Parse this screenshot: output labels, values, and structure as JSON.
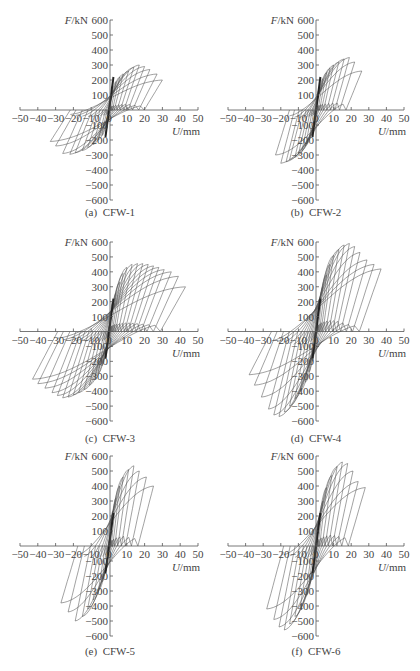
{
  "figure": {
    "x_unit_label": "U/mm",
    "y_unit_label": "F/kN"
  },
  "chart_data": [
    {
      "id": "a",
      "type": "line",
      "title": "(a) CFW-1",
      "caption_tag": "(a)",
      "specimen": "CFW-1",
      "xlabel": "U/mm",
      "ylabel": "F/kN",
      "xlim": [
        -50,
        50
      ],
      "ylim": [
        -600,
        600
      ],
      "xticks": [
        -50,
        -40,
        -30,
        -20,
        -10,
        0,
        10,
        20,
        30,
        40,
        50
      ],
      "yticks": [
        600,
        500,
        400,
        300,
        200,
        100,
        -100,
        -200,
        -300,
        -400,
        -500,
        -600
      ],
      "grid": false,
      "cycles": [
        {
          "xp": 2,
          "fp": 130,
          "xn": -2,
          "fn": -120
        },
        {
          "xp": 4,
          "fp": 190,
          "xn": -4,
          "fn": -170
        },
        {
          "xp": 6,
          "fp": 220,
          "xn": -6,
          "fn": -200
        },
        {
          "xp": 8,
          "fp": 240,
          "xn": -9,
          "fn": -230
        },
        {
          "xp": 11,
          "fp": 260,
          "xn": -12,
          "fn": -250
        },
        {
          "xp": 14,
          "fp": 285,
          "xn": -15,
          "fn": -270
        },
        {
          "xp": 17,
          "fp": 300,
          "xn": -19,
          "fn": -285
        },
        {
          "xp": 20,
          "fp": 290,
          "xn": -22,
          "fn": -295
        },
        {
          "xp": 23,
          "fp": 270,
          "xn": -26,
          "fn": -290
        },
        {
          "xp": 27,
          "fp": 240,
          "xn": -30,
          "fn": -240
        },
        {
          "xp": 30,
          "fp": 200,
          "xn": -33,
          "fn": -210
        }
      ]
    },
    {
      "id": "b",
      "type": "line",
      "title": "(b) CFW-2",
      "caption_tag": "(b)",
      "specimen": "CFW-2",
      "xlabel": "U/mm",
      "ylabel": "F/kN",
      "xlim": [
        -50,
        50
      ],
      "ylim": [
        -600,
        600
      ],
      "xticks": [
        -50,
        -40,
        -30,
        -20,
        -10,
        0,
        10,
        20,
        30,
        40,
        50
      ],
      "yticks": [
        600,
        500,
        400,
        300,
        200,
        100,
        -100,
        -200,
        -300,
        -400,
        -500,
        -600
      ],
      "grid": false,
      "cycles": [
        {
          "xp": 2,
          "fp": 150,
          "xn": -2,
          "fn": -140
        },
        {
          "xp": 4,
          "fp": 210,
          "xn": -4,
          "fn": -200
        },
        {
          "xp": 6,
          "fp": 250,
          "xn": -6,
          "fn": -240
        },
        {
          "xp": 8,
          "fp": 280,
          "xn": -8,
          "fn": -270
        },
        {
          "xp": 10,
          "fp": 300,
          "xn": -10,
          "fn": -295
        },
        {
          "xp": 13,
          "fp": 320,
          "xn": -12,
          "fn": -315
        },
        {
          "xp": 16,
          "fp": 340,
          "xn": -15,
          "fn": -330
        },
        {
          "xp": 19,
          "fp": 350,
          "xn": -17,
          "fn": -345
        },
        {
          "xp": 22,
          "fp": 320,
          "xn": -20,
          "fn": -355
        },
        {
          "xp": 26,
          "fp": 260,
          "xn": -23,
          "fn": -300
        }
      ]
    },
    {
      "id": "c",
      "type": "line",
      "title": "(c) CFW-3",
      "caption_tag": "(c)",
      "specimen": "CFW-3",
      "xlabel": "U/mm",
      "ylabel": "F/kN",
      "xlim": [
        -50,
        50
      ],
      "ylim": [
        -600,
        600
      ],
      "xticks": [
        -50,
        -40,
        -30,
        -20,
        -10,
        0,
        10,
        20,
        30,
        40,
        50
      ],
      "yticks": [
        600,
        500,
        400,
        300,
        200,
        100,
        -100,
        -200,
        -300,
        -400,
        -500,
        -600
      ],
      "grid": false,
      "cycles": [
        {
          "xp": 2,
          "fp": 200,
          "xn": -2,
          "fn": -180
        },
        {
          "xp": 4,
          "fp": 260,
          "xn": -4,
          "fn": -230
        },
        {
          "xp": 6,
          "fp": 330,
          "xn": -6,
          "fn": -280
        },
        {
          "xp": 8,
          "fp": 390,
          "xn": -8,
          "fn": -320
        },
        {
          "xp": 10,
          "fp": 430,
          "xn": -11,
          "fn": -360
        },
        {
          "xp": 13,
          "fp": 450,
          "xn": -14,
          "fn": -390
        },
        {
          "xp": 16,
          "fp": 455,
          "xn": -17,
          "fn": -410
        },
        {
          "xp": 19,
          "fp": 455,
          "xn": -20,
          "fn": -425
        },
        {
          "xp": 22,
          "fp": 450,
          "xn": -23,
          "fn": -440
        },
        {
          "xp": 25,
          "fp": 440,
          "xn": -26,
          "fn": -445
        },
        {
          "xp": 28,
          "fp": 430,
          "xn": -29,
          "fn": -430
        },
        {
          "xp": 31,
          "fp": 415,
          "xn": -32,
          "fn": -410
        },
        {
          "xp": 35,
          "fp": 400,
          "xn": -36,
          "fn": -380
        },
        {
          "xp": 39,
          "fp": 370,
          "xn": -40,
          "fn": -350
        },
        {
          "xp": 43,
          "fp": 300,
          "xn": -43,
          "fn": -320
        }
      ]
    },
    {
      "id": "d",
      "type": "line",
      "title": "(d) CFW-4",
      "caption_tag": "(d)",
      "specimen": "CFW-4",
      "xlabel": "U/mm",
      "ylabel": "F/kN",
      "xlim": [
        -50,
        50
      ],
      "ylim": [
        -600,
        600
      ],
      "xticks": [
        -50,
        -40,
        -30,
        -20,
        -10,
        0,
        10,
        20,
        30,
        40,
        50
      ],
      "yticks": [
        600,
        500,
        400,
        300,
        200,
        100,
        -100,
        -200,
        -300,
        -400,
        -500,
        -600
      ],
      "grid": false,
      "cycles": [
        {
          "xp": 2,
          "fp": 220,
          "xn": -2,
          "fn": -200
        },
        {
          "xp": 4,
          "fp": 300,
          "xn": -4,
          "fn": -270
        },
        {
          "xp": 6,
          "fp": 380,
          "xn": -6,
          "fn": -340
        },
        {
          "xp": 8,
          "fp": 450,
          "xn": -9,
          "fn": -400
        },
        {
          "xp": 10,
          "fp": 510,
          "xn": -12,
          "fn": -450
        },
        {
          "xp": 13,
          "fp": 550,
          "xn": -15,
          "fn": -500
        },
        {
          "xp": 16,
          "fp": 580,
          "xn": -18,
          "fn": -540
        },
        {
          "xp": 19,
          "fp": 590,
          "xn": -21,
          "fn": -570
        },
        {
          "xp": 22,
          "fp": 570,
          "xn": -24,
          "fn": -560
        },
        {
          "xp": 25,
          "fp": 530,
          "xn": -27,
          "fn": -520
        },
        {
          "xp": 29,
          "fp": 480,
          "xn": -31,
          "fn": -440
        },
        {
          "xp": 33,
          "fp": 450,
          "xn": -35,
          "fn": -360
        },
        {
          "xp": 37,
          "fp": 420,
          "xn": -38,
          "fn": -290
        }
      ]
    },
    {
      "id": "e",
      "type": "line",
      "title": "(e) CFW-5",
      "caption_tag": "(e)",
      "specimen": "CFW-5",
      "xlabel": "U/mm",
      "ylabel": "F/kN",
      "xlim": [
        -50,
        50
      ],
      "ylim": [
        -600,
        600
      ],
      "xticks": [
        -50,
        -40,
        -30,
        -20,
        -10,
        0,
        10,
        20,
        30,
        40,
        50
      ],
      "yticks": [
        600,
        500,
        400,
        300,
        200,
        100,
        -100,
        -200,
        -300,
        -400,
        -500,
        -600
      ],
      "grid": false,
      "cycles": [
        {
          "xp": 2,
          "fp": 230,
          "xn": -2,
          "fn": -170
        },
        {
          "xp": 4,
          "fp": 320,
          "xn": -4,
          "fn": -240
        },
        {
          "xp": 6,
          "fp": 400,
          "xn": -6,
          "fn": -300
        },
        {
          "xp": 8,
          "fp": 460,
          "xn": -9,
          "fn": -360
        },
        {
          "xp": 11,
          "fp": 510,
          "xn": -12,
          "fn": -420
        },
        {
          "xp": 14,
          "fp": 535,
          "xn": -15,
          "fn": -470
        },
        {
          "xp": 17,
          "fp": 500,
          "xn": -19,
          "fn": -500
        },
        {
          "xp": 21,
          "fp": 460,
          "xn": -23,
          "fn": -440
        },
        {
          "xp": 25,
          "fp": 400,
          "xn": -27,
          "fn": -380
        }
      ]
    },
    {
      "id": "f",
      "type": "line",
      "title": "(f) CFW-6",
      "caption_tag": "(f)",
      "specimen": "CFW-6",
      "xlabel": "U/mm",
      "ylabel": "F/kN",
      "xlim": [
        -50,
        50
      ],
      "ylim": [
        -600,
        600
      ],
      "xticks": [
        -50,
        -40,
        -30,
        -20,
        -10,
        0,
        10,
        20,
        30,
        40,
        50
      ],
      "yticks": [
        600,
        500,
        400,
        300,
        200,
        100,
        -100,
        -200,
        -300,
        -400,
        -500,
        -600
      ],
      "grid": false,
      "cycles": [
        {
          "xp": 2,
          "fp": 200,
          "xn": -2,
          "fn": -180
        },
        {
          "xp": 4,
          "fp": 300,
          "xn": -4,
          "fn": -260
        },
        {
          "xp": 6,
          "fp": 390,
          "xn": -6,
          "fn": -340
        },
        {
          "xp": 9,
          "fp": 470,
          "xn": -9,
          "fn": -410
        },
        {
          "xp": 12,
          "fp": 530,
          "xn": -12,
          "fn": -470
        },
        {
          "xp": 15,
          "fp": 560,
          "xn": -15,
          "fn": -520
        },
        {
          "xp": 18,
          "fp": 550,
          "xn": -18,
          "fn": -560
        },
        {
          "xp": 21,
          "fp": 500,
          "xn": -21,
          "fn": -540
        },
        {
          "xp": 24,
          "fp": 430,
          "xn": -24,
          "fn": -490
        },
        {
          "xp": 28,
          "fp": 390,
          "xn": -28,
          "fn": -420
        }
      ]
    }
  ]
}
